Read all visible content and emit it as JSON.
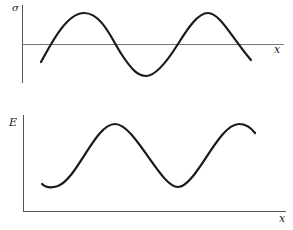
{
  "panels": [
    {
      "id": "stress",
      "y_label": "σ",
      "x_label": "x",
      "curve": "sinusoidal wave about zero axis, two peaks",
      "color": "#1a1a1a"
    },
    {
      "id": "energy",
      "y_label": "E",
      "x_label": "x",
      "curve": "sinusoidal wave, positive values, two peaks",
      "color": "#1a1a1a"
    }
  ],
  "axis_color": "#555555"
}
